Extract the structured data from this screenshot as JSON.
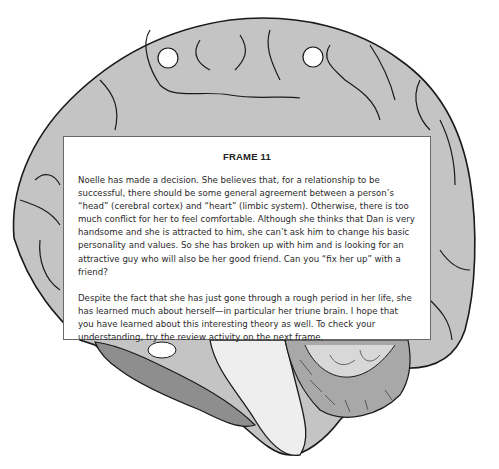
{
  "frame": {
    "title": "FRAME 11",
    "paragraphs": [
      "Noelle has made a decision. She believes that, for a relationship to be successful, there should be some general agreement between a person’s “head” (cerebral cortex) and “heart” (limbic system). Otherwise, there is too much conflict for her to feel comfortable. Although she thinks that Dan is very handsome and she is attracted to him, she can’t ask him to change his basic personality and values. So she has broken up with him and is looking for an attractive guy who will also be her good friend. Can you “fix her up” with a friend?",
      "Despite the fact that she has just gone through a rough period in her life, she has learned much about herself—in particular her triune brain. I hope that you have learned about this interesting theory as well. To check your understanding, try the review activity on the next frame."
    ]
  },
  "illustration": {
    "subject": "brain-cross-section",
    "colors": {
      "cortex": "#c4c4c4",
      "outline": "#1a1a1a",
      "limbic": "#8e8e8e",
      "brainstem": "#eeeeee"
    }
  }
}
